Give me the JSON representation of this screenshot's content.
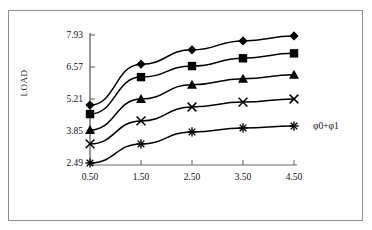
{
  "chart_data": {
    "type": "line",
    "title": "",
    "xlabel": "φ0+φ1",
    "ylabel": "LOAD",
    "x": [
      0.5,
      1.5,
      2.5,
      3.5,
      4.5
    ],
    "xticklabels": [
      "0.50",
      "1.50",
      "2.50",
      "3.50",
      "4.50"
    ],
    "yticklabels": [
      "2.49",
      "3.85",
      "5.21",
      "6.57",
      "7.93"
    ],
    "ylim": [
      2.49,
      7.93
    ],
    "xlim": [
      0.0,
      5.0
    ],
    "grid": false,
    "legend": "none",
    "series": [
      {
        "name": "series-1",
        "marker": "diamond",
        "values": [
          4.95,
          6.69,
          7.3,
          7.68,
          7.89
        ]
      },
      {
        "name": "series-2",
        "marker": "square",
        "values": [
          4.57,
          6.14,
          6.61,
          6.94,
          7.15
        ]
      },
      {
        "name": "series-3",
        "marker": "triangle",
        "values": [
          3.89,
          5.21,
          5.82,
          6.07,
          6.24
        ]
      },
      {
        "name": "series-4",
        "marker": "cross",
        "values": [
          3.3,
          4.28,
          4.87,
          5.08,
          5.21
        ]
      },
      {
        "name": "series-5",
        "marker": "asterisk",
        "values": [
          2.49,
          3.3,
          3.81,
          3.98,
          4.06
        ]
      }
    ]
  },
  "axis": {
    "y_ticks": [
      "7.93",
      "6.57",
      "5.21",
      "3.85",
      "2.49"
    ],
    "x_ticks": [
      "0.50",
      "1.50",
      "2.50",
      "3.50",
      "4.50"
    ],
    "y_title": "LOAD",
    "x_title": "φ0+φ1"
  },
  "style": {
    "line_color": "#000000",
    "marker_color": "#000000",
    "axis_color": "#6b6b6b",
    "frame_color": "#8d8d8d",
    "background": "#ffffff"
  }
}
